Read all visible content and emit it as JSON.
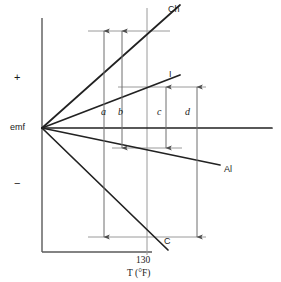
{
  "figure": {
    "type": "thermocouple-emf-vs-temperature-diagram",
    "colors": {
      "ink": "#1a1a1a",
      "curve": "#222222",
      "guide": "#8c8c8c",
      "axis": "#5a5a5a",
      "background": "#ffffff"
    }
  },
  "axes": {
    "y_label": "emf",
    "y_positive_sign": "+",
    "y_negative_sign": "−",
    "x_label": "T (°F)",
    "x_tick_value": "130",
    "origin": {
      "x": 42,
      "y": 128
    },
    "x_axis_y": 252,
    "y_axis_x": 42,
    "plot_right": 272,
    "plot_top": 18,
    "tick_x": 147
  },
  "curves": [
    {
      "id": "chromel",
      "label": "Ch",
      "label_x": 168,
      "label_y": 9,
      "end_x": 164,
      "end_y": 16,
      "polarity": "positive"
    },
    {
      "id": "iron",
      "label": "I",
      "label_x": 168,
      "label_y": 72,
      "end_x": 164,
      "end_y": 81,
      "polarity": "positive"
    },
    {
      "id": "zero-reference",
      "label": "",
      "label_x": 0,
      "label_y": 0,
      "end_x": 272,
      "end_y": 128,
      "polarity": "zero"
    },
    {
      "id": "alumel",
      "label": "Al",
      "label_x": 224,
      "label_y": 167,
      "end_x": 216,
      "end_y": 163,
      "polarity": "negative"
    },
    {
      "id": "constantan",
      "label": "C",
      "label_x": 164,
      "label_y": 239,
      "end_x": 158,
      "end_y": 246,
      "polarity": "negative"
    }
  ],
  "guide_lines": [
    {
      "id": "guide-top",
      "x1": 88,
      "x2": 170,
      "y": 31
    },
    {
      "id": "guide-iron",
      "x1": 118,
      "x2": 206,
      "y": 87
    },
    {
      "id": "guide-alumel",
      "x1": 112,
      "x2": 182,
      "y": 148
    },
    {
      "id": "guide-bottom",
      "x1": 88,
      "x2": 206,
      "y": 237
    }
  ],
  "measurements": [
    {
      "id": "a",
      "label": "a",
      "x": 104,
      "top": 31,
      "bottom": 237,
      "label_x": 103,
      "label_y": 108
    },
    {
      "id": "b",
      "label": "b",
      "x": 122,
      "top": 31,
      "bottom": 148,
      "label_x": 119,
      "label_y": 108
    },
    {
      "id": "c",
      "label": "c",
      "x": 166,
      "top": 87,
      "bottom": 148,
      "label_x": 160,
      "label_y": 108
    },
    {
      "id": "d",
      "label": "d",
      "x": 197,
      "top": 87,
      "bottom": 237,
      "label_x": 186,
      "label_y": 108
    }
  ],
  "text_labels": {
    "emf": "emf",
    "plus": "+",
    "minus": "−",
    "tick_130": "130",
    "x_axis_title": "T (°F)",
    "ch": "Ch",
    "i": "I",
    "al": "Al",
    "c": "C",
    "a": "a",
    "b": "b",
    "c_measure": "c",
    "d": "d"
  }
}
